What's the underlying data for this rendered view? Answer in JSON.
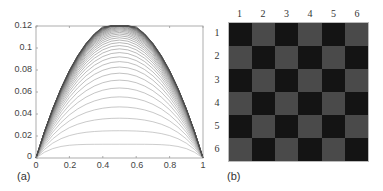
{
  "panel_a": {
    "label": "(a)",
    "y_ticks": [
      "0.12",
      "0.1",
      "0.08",
      "0.06",
      "0.04",
      "0.02",
      "0"
    ],
    "x_ticks": [
      "0",
      "0.2",
      "0.4",
      "0.6",
      "0.8",
      "1"
    ]
  },
  "panel_b": {
    "label": "(b)",
    "col_labels": [
      "1",
      "2",
      "3",
      "4",
      "5",
      "6"
    ],
    "row_labels": [
      "1",
      "2",
      "3",
      "4",
      "5",
      "6"
    ],
    "colors": {
      "dark": "#141414",
      "light": "#4a4a4a"
    }
  },
  "chart_data": [
    {
      "type": "line",
      "title": "",
      "panel": "(a)",
      "xlabel": "",
      "ylabel": "",
      "xlim": [
        0,
        1
      ],
      "ylim": [
        0,
        0.12
      ],
      "x_ticks": [
        0,
        0.2,
        0.4,
        0.6,
        0.8,
        1
      ],
      "y_ticks": [
        0,
        0.02,
        0.04,
        0.06,
        0.08,
        0.1,
        0.12
      ],
      "grid": false,
      "legend": null,
      "description": "Family of ~40 piecewise-linear profiles u(x) with u(0)=u(1)=0, growing iteratively toward a parabola-like shape; flat-topped, outermost curve peaks near 0.116 at x=0.5. Lower curves form a diamond lattice.",
      "series_model": {
        "grid_intervals": 20,
        "source_term": 1,
        "num_curves": 40,
        "scheme": "Jacobi iteration for -u''=1 starting from zero"
      },
      "envelope_samples": {
        "x": [
          0,
          0.1,
          0.2,
          0.3,
          0.4,
          0.5,
          0.6,
          0.7,
          0.8,
          0.9,
          1
        ],
        "y": [
          0,
          0.045,
          0.08,
          0.1,
          0.112,
          0.116,
          0.112,
          0.1,
          0.08,
          0.045,
          0
        ]
      },
      "line_color": "#555555"
    },
    {
      "type": "heatmap",
      "title": "",
      "panel": "(b)",
      "x_labels": [
        "1",
        "2",
        "3",
        "4",
        "5",
        "6"
      ],
      "y_labels": [
        "1",
        "2",
        "3",
        "4",
        "5",
        "6"
      ],
      "values": [
        [
          0,
          1,
          0,
          1,
          0,
          1
        ],
        [
          1,
          0,
          1,
          0,
          1,
          0
        ],
        [
          0,
          1,
          0,
          1,
          0,
          1
        ],
        [
          1,
          0,
          1,
          0,
          1,
          0
        ],
        [
          0,
          1,
          0,
          1,
          0,
          1
        ],
        [
          1,
          0,
          1,
          0,
          1,
          0
        ]
      ],
      "colormap": {
        "0": "#141414",
        "1": "#4a4a4a"
      },
      "description": "6x6 checkerboard pattern"
    }
  ]
}
